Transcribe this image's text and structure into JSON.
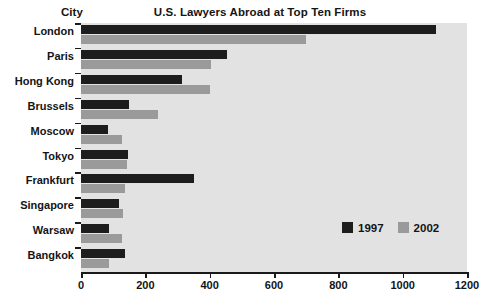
{
  "chart_data": {
    "type": "bar",
    "orientation": "horizontal",
    "title": "U.S. Lawyers Abroad at Top Ten Firms",
    "xlabel": "",
    "ylabel": "City",
    "categories": [
      "London",
      "Paris",
      "Hong Kong",
      "Brussels",
      "Moscow",
      "Tokyo",
      "Frankfurt",
      "Singapore",
      "Warsaw",
      "Bangkok"
    ],
    "series": [
      {
        "name": "1997",
        "color": "#1d1d1d",
        "values": [
          1105,
          455,
          315,
          150,
          85,
          145,
          350,
          118,
          88,
          138
        ]
      },
      {
        "name": "2002",
        "color": "#9a9a9a",
        "values": [
          700,
          405,
          400,
          240,
          128,
          143,
          138,
          130,
          128,
          88
        ]
      }
    ],
    "xlim": [
      0,
      1200
    ],
    "xticks": [
      0,
      200,
      400,
      600,
      800,
      1000,
      1200
    ],
    "xtick_labels": [
      "0",
      "200",
      "400",
      "600",
      "800",
      "1000",
      "1200"
    ],
    "grid": false,
    "legend_position": "inside-right",
    "plot_background": "#e2e2e2"
  },
  "legend": {
    "entries": [
      {
        "label": "1997"
      },
      {
        "label": "2002"
      }
    ]
  },
  "axis": {
    "city_header": "City"
  }
}
